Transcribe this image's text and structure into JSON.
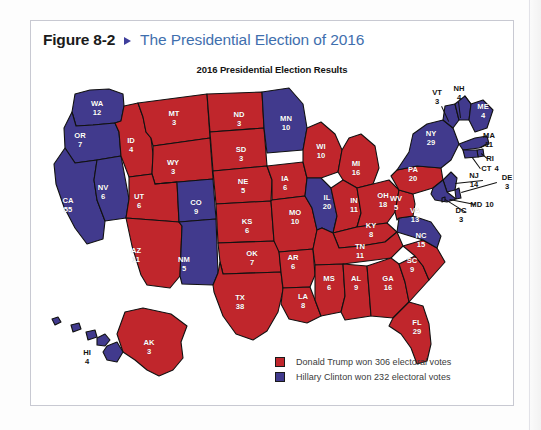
{
  "figure": {
    "number": "Figure 8-2",
    "arrow_icon": "triangle-right-icon",
    "title": "The Presidential Election of 2016"
  },
  "map": {
    "title": "2016 Presidential Election Results",
    "colors": {
      "republican_red": "#c0262c",
      "democrat_blue": "#413a8d",
      "border": "#111111",
      "label_inside": "#ffffff",
      "label_outside": "#121212",
      "panel_border": "#c8c9d2",
      "figure_number": "#1b1b1b",
      "figure_title": "#3f6fae",
      "arrow": "#3f3f9c"
    }
  },
  "legend": {
    "items": [
      {
        "swatch": "red",
        "color": "#c0262c",
        "label": "Donald Trump won 306 electoral votes"
      },
      {
        "swatch": "blue",
        "color": "#413a8d",
        "label": "Hillary Clinton won 232 electoral votes"
      }
    ]
  },
  "chart_data": {
    "type": "map",
    "title": "2016 Presidential Election Results",
    "subtitle": "The Presidential Election of 2016",
    "legend_position": "bottom-right",
    "series": [
      {
        "name": "Donald Trump",
        "party": "Republican",
        "color": "#c0262c",
        "electoral_votes": 306
      },
      {
        "name": "Hillary Clinton",
        "party": "Democrat",
        "color": "#413a8d",
        "electoral_votes": 232
      }
    ],
    "categories": [
      "WA",
      "OR",
      "CA",
      "NV",
      "ID",
      "MT",
      "WY",
      "UT",
      "AZ",
      "CO",
      "NM",
      "ND",
      "SD",
      "NE",
      "KS",
      "OK",
      "TX",
      "MN",
      "IA",
      "MO",
      "AR",
      "LA",
      "WI",
      "IL",
      "MI",
      "IN",
      "OH",
      "KY",
      "TN",
      "MS",
      "AL",
      "GA",
      "FL",
      "SC",
      "NC",
      "VA",
      "WV",
      "PA",
      "NY",
      "VT",
      "NH",
      "ME",
      "MA",
      "RI",
      "CT",
      "NJ",
      "DE",
      "MD",
      "DC",
      "AK",
      "HI"
    ],
    "values": [
      12,
      7,
      55,
      6,
      4,
      3,
      3,
      6,
      11,
      9,
      5,
      3,
      3,
      5,
      6,
      7,
      38,
      10,
      6,
      10,
      6,
      8,
      10,
      20,
      16,
      11,
      18,
      8,
      11,
      6,
      9,
      16,
      29,
      9,
      15,
      13,
      5,
      20,
      29,
      3,
      4,
      4,
      11,
      4,
      7,
      14,
      3,
      10,
      3,
      3,
      4
    ],
    "winners": [
      "Clinton",
      "Clinton",
      "Clinton",
      "Clinton",
      "Trump",
      "Trump",
      "Trump",
      "Trump",
      "Trump",
      "Clinton",
      "Clinton",
      "Trump",
      "Trump",
      "Trump",
      "Trump",
      "Trump",
      "Trump",
      "Clinton",
      "Trump",
      "Trump",
      "Trump",
      "Trump",
      "Trump",
      "Clinton",
      "Trump",
      "Trump",
      "Trump",
      "Trump",
      "Trump",
      "Trump",
      "Trump",
      "Trump",
      "Trump",
      "Trump",
      "Trump",
      "Clinton",
      "Trump",
      "Trump",
      "Clinton",
      "Clinton",
      "Clinton",
      "Clinton",
      "Clinton",
      "Clinton",
      "Clinton",
      "Clinton",
      "Clinton",
      "Clinton",
      "Clinton",
      "Trump",
      "Clinton"
    ]
  },
  "states": [
    {
      "abbr": "WA",
      "votes": "12",
      "x": 66,
      "y": 33,
      "outside": false,
      "inline": false
    },
    {
      "abbr": "OR",
      "votes": "7",
      "x": 49,
      "y": 65,
      "outside": false,
      "inline": false
    },
    {
      "abbr": "CA",
      "votes": "55",
      "x": 37,
      "y": 130,
      "outside": false,
      "inline": false
    },
    {
      "abbr": "NV",
      "votes": "6",
      "x": 72,
      "y": 117,
      "outside": false,
      "inline": false
    },
    {
      "abbr": "ID",
      "votes": "4",
      "x": 100,
      "y": 70,
      "outside": false,
      "inline": false
    },
    {
      "abbr": "MT",
      "votes": "3",
      "x": 143,
      "y": 43,
      "outside": false,
      "inline": false
    },
    {
      "abbr": "WY",
      "votes": "3",
      "x": 142,
      "y": 92,
      "outside": false,
      "inline": false
    },
    {
      "abbr": "UT",
      "votes": "6",
      "x": 108,
      "y": 126,
      "outside": false,
      "inline": false
    },
    {
      "abbr": "AZ",
      "votes": "11",
      "x": 105,
      "y": 180,
      "outside": false,
      "inline": false
    },
    {
      "abbr": "CO",
      "votes": "9",
      "x": 165,
      "y": 132,
      "outside": false,
      "inline": false
    },
    {
      "abbr": "NM",
      "votes": "5",
      "x": 153,
      "y": 189,
      "outside": false,
      "inline": false
    },
    {
      "abbr": "ND",
      "votes": "3",
      "x": 208,
      "y": 44,
      "outside": false,
      "inline": false
    },
    {
      "abbr": "SD",
      "votes": "3",
      "x": 210,
      "y": 79,
      "outside": false,
      "inline": false
    },
    {
      "abbr": "NE",
      "votes": "5",
      "x": 212,
      "y": 111,
      "outside": false,
      "inline": false
    },
    {
      "abbr": "KS",
      "votes": "6",
      "x": 216,
      "y": 151,
      "outside": false,
      "inline": false
    },
    {
      "abbr": "OK",
      "votes": "7",
      "x": 221,
      "y": 183,
      "outside": false,
      "inline": false
    },
    {
      "abbr": "TX",
      "votes": "38",
      "x": 209,
      "y": 227,
      "outside": false,
      "inline": false
    },
    {
      "abbr": "MN",
      "votes": "10",
      "x": 255,
      "y": 48,
      "outside": false,
      "inline": false
    },
    {
      "abbr": "IA",
      "votes": "6",
      "x": 254,
      "y": 108,
      "outside": false,
      "inline": false
    },
    {
      "abbr": "MO",
      "votes": "10",
      "x": 264,
      "y": 142,
      "outside": false,
      "inline": false
    },
    {
      "abbr": "AR",
      "votes": "6",
      "x": 262,
      "y": 187,
      "outside": false,
      "inline": false
    },
    {
      "abbr": "LA",
      "votes": "8",
      "x": 272,
      "y": 226,
      "outside": false,
      "inline": false
    },
    {
      "abbr": "WI",
      "votes": "10",
      "x": 290,
      "y": 76,
      "outside": false,
      "inline": false
    },
    {
      "abbr": "IL",
      "votes": "20",
      "x": 296,
      "y": 127,
      "outside": false,
      "inline": false
    },
    {
      "abbr": "MI",
      "votes": "16",
      "x": 325,
      "y": 93,
      "outside": false,
      "inline": false
    },
    {
      "abbr": "IN",
      "votes": "11",
      "x": 323,
      "y": 130,
      "outside": false,
      "inline": false
    },
    {
      "abbr": "OH",
      "votes": "18",
      "x": 352,
      "y": 125,
      "outside": false,
      "inline": false
    },
    {
      "abbr": "KY",
      "votes": "8",
      "x": 340,
      "y": 155,
      "outside": false,
      "inline": false
    },
    {
      "abbr": "TN",
      "votes": "11",
      "x": 329,
      "y": 176,
      "outside": false,
      "inline": false
    },
    {
      "abbr": "MS",
      "votes": "6",
      "x": 298,
      "y": 208,
      "outside": false,
      "inline": false
    },
    {
      "abbr": "AL",
      "votes": "9",
      "x": 325,
      "y": 208,
      "outside": false,
      "inline": false
    },
    {
      "abbr": "GA",
      "votes": "16",
      "x": 357,
      "y": 208,
      "outside": false,
      "inline": false
    },
    {
      "abbr": "FL",
      "votes": "29",
      "x": 386,
      "y": 252,
      "outside": false,
      "inline": false
    },
    {
      "abbr": "SC",
      "votes": "9",
      "x": 381,
      "y": 190,
      "outside": false,
      "inline": false
    },
    {
      "abbr": "NC",
      "votes": "15",
      "x": 390,
      "y": 165,
      "outside": false,
      "inline": false
    },
    {
      "abbr": "VA",
      "votes": "13",
      "x": 384,
      "y": 140,
      "outside": false,
      "inline": false
    },
    {
      "abbr": "WV",
      "votes": "5",
      "x": 365,
      "y": 128,
      "outside": false,
      "inline": false
    },
    {
      "abbr": "PA",
      "votes": "20",
      "x": 382,
      "y": 99,
      "outside": false,
      "inline": false
    },
    {
      "abbr": "NY",
      "votes": "29",
      "x": 400,
      "y": 63,
      "outside": false,
      "inline": false
    },
    {
      "abbr": "VT",
      "votes": "3",
      "x": 406,
      "y": 22,
      "outside": true,
      "inline": false
    },
    {
      "abbr": "NH",
      "votes": "4",
      "x": 428,
      "y": 18,
      "outside": true,
      "inline": false
    },
    {
      "abbr": "ME",
      "votes": "4",
      "x": 452,
      "y": 36,
      "outside": false,
      "inline": false
    },
    {
      "abbr": "MA",
      "votes": "11",
      "x": 458,
      "y": 65,
      "outside": true,
      "inline": false
    },
    {
      "abbr": "RI",
      "votes": "",
      "x": 459,
      "y": 83,
      "outside": true,
      "inline": true
    },
    {
      "abbr": "CT",
      "votes": "4",
      "x": 459,
      "y": 93,
      "outside": true,
      "inline": true
    },
    {
      "abbr": "NJ",
      "votes": "14",
      "x": 443,
      "y": 105,
      "outside": true,
      "inline": false
    },
    {
      "abbr": "DE",
      "votes": "3",
      "x": 476,
      "y": 107,
      "outside": true,
      "inline": false
    },
    {
      "abbr": "MD",
      "votes": "10",
      "x": 451,
      "y": 129,
      "outside": true,
      "inline": true
    },
    {
      "abbr": "DC",
      "votes": "3",
      "x": 430,
      "y": 140,
      "outside": true,
      "inline": false
    },
    {
      "abbr": "AK",
      "votes": "3",
      "x": 118,
      "y": 272,
      "outside": false,
      "inline": false
    },
    {
      "abbr": "HI",
      "votes": "4",
      "x": 56,
      "y": 282,
      "outside": true,
      "inline": false
    }
  ]
}
